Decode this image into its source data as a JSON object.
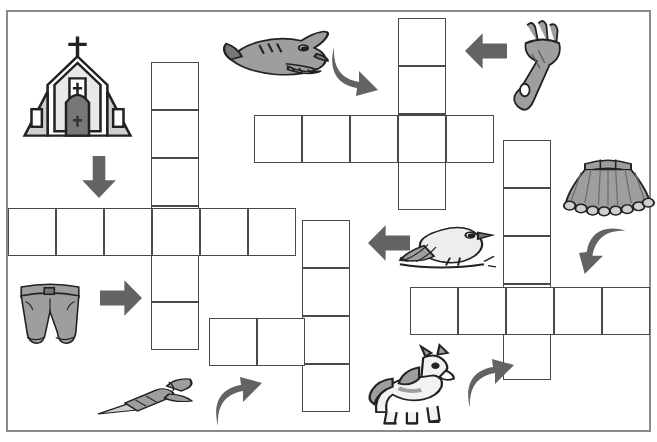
{
  "puzzle": {
    "title": "Picture Crossword Puzzle",
    "type": "picture-crossword",
    "cell_size": 48,
    "border": {
      "x": 6,
      "y": 10,
      "width": 645,
      "height": 422,
      "color": "#8a8a8a"
    },
    "cell_color": "#4a4a4a",
    "fill_color": "#ffffff",
    "arrow_color": "#636363",
    "clues": [
      {
        "id": "church",
        "icon_name": "church-icon",
        "label": "church",
        "direction": "down",
        "arrow": "down-straight",
        "answer_length": 6
      },
      {
        "id": "shark",
        "icon_name": "shark-icon",
        "label": "shark",
        "direction": "down",
        "arrow": "down-curved",
        "answer_length": 5
      },
      {
        "id": "fork",
        "icon_name": "fork-icon",
        "label": "fork",
        "direction": "left",
        "arrow": "left-straight",
        "answer_length": 4
      },
      {
        "id": "skirt",
        "icon_name": "skirt-icon",
        "label": "skirt",
        "direction": "left",
        "arrow": "left-curved",
        "answer_length": 5
      },
      {
        "id": "shorts",
        "icon_name": "shorts-icon",
        "label": "shorts",
        "direction": "right",
        "arrow": "right-straight",
        "answer_length": 6
      },
      {
        "id": "bird",
        "icon_name": "bird-icon",
        "label": "bird",
        "direction": "left",
        "arrow": "left-straight",
        "answer_length": 4
      },
      {
        "id": "dart",
        "icon_name": "dart-icon",
        "label": "dart",
        "direction": "up",
        "arrow": "up-curved",
        "answer_length": 4
      },
      {
        "id": "horse",
        "icon_name": "horse-icon",
        "label": "horse",
        "direction": "up",
        "arrow": "up-curved",
        "answer_length": 5
      }
    ],
    "words": [
      {
        "name": "word-church-down",
        "orientation": "vertical",
        "x": 151,
        "y": 62,
        "cells": 6
      },
      {
        "name": "word-shorts-across",
        "orientation": "horizontal",
        "x": 8,
        "y": 208,
        "cells": 6
      },
      {
        "name": "word-shark-down",
        "orientation": "vertical",
        "x": 398,
        "y": 18,
        "cells": 4
      },
      {
        "name": "word-fork-across",
        "orientation": "horizontal",
        "x": 254,
        "y": 115,
        "cells": 5
      },
      {
        "name": "word-skirt-down",
        "orientation": "vertical",
        "x": 503,
        "y": 140,
        "cells": 5
      },
      {
        "name": "word-bird-across",
        "orientation": "horizontal",
        "x": 410,
        "y": 287,
        "cells": 5
      },
      {
        "name": "word-dart-down",
        "orientation": "vertical",
        "x": 302,
        "y": 220,
        "cells": 4
      },
      {
        "name": "word-horse-across",
        "orientation": "horizontal",
        "x": 209,
        "y": 318,
        "cells": 2
      }
    ],
    "arrows": [
      {
        "name": "arrow-church-down",
        "kind": "down-straight",
        "x": 78,
        "y": 145,
        "w": 42,
        "h": 64
      },
      {
        "name": "arrow-shark-down",
        "kind": "down-curved",
        "x": 330,
        "y": 32,
        "w": 50,
        "h": 78
      },
      {
        "name": "arrow-fork-left",
        "kind": "left-straight",
        "x": 452,
        "y": 30,
        "w": 68,
        "h": 42
      },
      {
        "name": "arrow-skirt-left",
        "kind": "left-curved",
        "x": 570,
        "y": 228,
        "w": 66,
        "h": 48
      },
      {
        "name": "arrow-shorts-right",
        "kind": "right-straight",
        "x": 91,
        "y": 277,
        "w": 60,
        "h": 42
      },
      {
        "name": "arrow-bird-left",
        "kind": "left-straight",
        "x": 358,
        "y": 222,
        "w": 62,
        "h": 42
      },
      {
        "name": "arrow-dart-up",
        "kind": "up-curved",
        "x": 214,
        "y": 368,
        "w": 50,
        "h": 68
      },
      {
        "name": "arrow-horse-up",
        "kind": "up-curved",
        "x": 466,
        "y": 348,
        "w": 50,
        "h": 72
      }
    ],
    "pictures": [
      {
        "name": "church-icon",
        "x": 20,
        "y": 30,
        "w": 115,
        "h": 110
      },
      {
        "name": "shark-icon",
        "x": 222,
        "y": 22,
        "w": 110,
        "h": 72
      },
      {
        "name": "fork-icon",
        "x": 500,
        "y": 18,
        "w": 80,
        "h": 90
      },
      {
        "name": "skirt-icon",
        "x": 560,
        "y": 148,
        "w": 96,
        "h": 72
      },
      {
        "name": "shorts-icon",
        "x": 14,
        "y": 277,
        "w": 72,
        "h": 72
      },
      {
        "name": "bird-icon",
        "x": 398,
        "y": 218,
        "w": 100,
        "h": 66
      },
      {
        "name": "dart-icon",
        "x": 96,
        "y": 372,
        "w": 104,
        "h": 50
      },
      {
        "name": "horse-icon",
        "x": 362,
        "y": 345,
        "w": 102,
        "h": 80
      }
    ]
  }
}
